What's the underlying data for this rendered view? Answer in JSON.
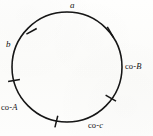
{
  "figure": {
    "type": "circle-diagram",
    "background_color": "#fdfdfb",
    "ink_color": "#141414",
    "canvas": {
      "width": 153,
      "height": 136
    },
    "circle": {
      "center_x": 67,
      "center_y": 67,
      "radius": 55,
      "stroke_width": 1.6
    },
    "labels": {
      "a": "a",
      "b": "b",
      "co_a_prefix": "co-",
      "co_a_var": "A",
      "co_b_prefix": "co-",
      "co_b_var": "B",
      "co_c_prefix": "co-",
      "co_c_var": "c"
    },
    "tick_marks": [
      {
        "name": "tick-upper-left",
        "angle_deg": 145
      },
      {
        "name": "tick-upper-right",
        "angle_deg": 46
      },
      {
        "name": "tick-left",
        "angle_deg": 190
      },
      {
        "name": "tick-lower-right",
        "angle_deg": -34
      },
      {
        "name": "tick-bottom",
        "angle_deg": -104
      },
      {
        "name": "tick-bottom-left",
        "angle_deg": -96
      }
    ]
  }
}
